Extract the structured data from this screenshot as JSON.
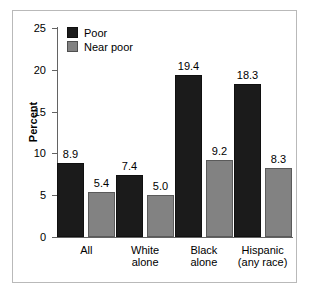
{
  "chart_data": {
    "type": "bar",
    "title": "",
    "xlabel": "",
    "ylabel": "Percent",
    "ylim": [
      0,
      25
    ],
    "yticks": [
      0,
      5,
      10,
      15,
      20,
      25
    ],
    "ytick_labels": [
      "0",
      "5",
      "10",
      "15",
      "20",
      "25"
    ],
    "grid": false,
    "legend_position": "top-left inside plot",
    "categories": [
      "All",
      "White\nalone",
      "Black\nalone",
      "Hispanic\n(any race)"
    ],
    "series": [
      {
        "name": "Poor",
        "color": "#1b1b1b",
        "values": [
          8.9,
          7.4,
          19.4,
          18.3
        ],
        "value_labels": [
          "8.9",
          "7.4",
          "19.4",
          "18.3"
        ]
      },
      {
        "name": "Near poor",
        "color": "#828282",
        "values": [
          5.4,
          5.0,
          9.2,
          8.3
        ],
        "value_labels": [
          "5.4",
          "5.0",
          "9.2",
          "8.3"
        ]
      }
    ]
  },
  "legend": {
    "items": [
      {
        "label": "Poor",
        "swatch": "poor-swatch"
      },
      {
        "label": "Near poor",
        "swatch": "near-poor-swatch"
      }
    ]
  },
  "colors": {
    "poor": "#1b1b1b",
    "near_poor": "#828282",
    "axis": "#636363",
    "frame": "#b9b9b9",
    "background": "#ffffff"
  }
}
